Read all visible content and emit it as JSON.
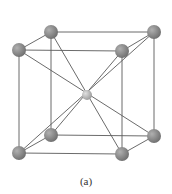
{
  "figure": {
    "caption": "(a)",
    "structure": "body-centered cubic unit cell",
    "colors": {
      "bond": "#5a5a5a",
      "corner_atom": "#6e6e6e",
      "corner_highlight": "#b0b0b0",
      "center_atom": "#9a9a9a",
      "center_highlight": "#e0e0e0"
    },
    "atoms": [
      {
        "id": "back-top-left",
        "x": 51,
        "y": 32,
        "r": 7,
        "type": "corner"
      },
      {
        "id": "back-top-right",
        "x": 154,
        "y": 32,
        "r": 7,
        "type": "corner"
      },
      {
        "id": "front-top-left",
        "x": 19,
        "y": 50,
        "r": 7,
        "type": "corner"
      },
      {
        "id": "front-top-right",
        "x": 122,
        "y": 51,
        "r": 7,
        "type": "corner"
      },
      {
        "id": "back-bottom-left",
        "x": 51,
        "y": 135,
        "r": 7,
        "type": "corner"
      },
      {
        "id": "back-bottom-right",
        "x": 154,
        "y": 136,
        "r": 7,
        "type": "corner"
      },
      {
        "id": "front-bottom-left",
        "x": 19,
        "y": 153,
        "r": 7,
        "type": "corner"
      },
      {
        "id": "front-bottom-right",
        "x": 122,
        "y": 154,
        "r": 7,
        "type": "corner"
      },
      {
        "id": "body-center",
        "x": 87,
        "y": 95,
        "r": 5,
        "type": "center"
      }
    ],
    "edges": [
      [
        "back-top-left",
        "back-top-right"
      ],
      [
        "front-top-left",
        "front-top-right"
      ],
      [
        "back-top-left",
        "front-top-left"
      ],
      [
        "back-top-right",
        "front-top-right"
      ],
      [
        "back-bottom-left",
        "back-bottom-right"
      ],
      [
        "front-bottom-left",
        "front-bottom-right"
      ],
      [
        "back-bottom-left",
        "front-bottom-left"
      ],
      [
        "back-bottom-right",
        "front-bottom-right"
      ],
      [
        "back-top-left",
        "back-bottom-left"
      ],
      [
        "back-top-right",
        "back-bottom-right"
      ],
      [
        "front-top-left",
        "front-bottom-left"
      ],
      [
        "front-top-right",
        "front-bottom-right"
      ],
      [
        "back-top-left",
        "front-bottom-right"
      ],
      [
        "back-top-right",
        "front-bottom-left"
      ],
      [
        "front-top-left",
        "back-bottom-right"
      ],
      [
        "front-top-right",
        "back-bottom-left"
      ]
    ]
  }
}
